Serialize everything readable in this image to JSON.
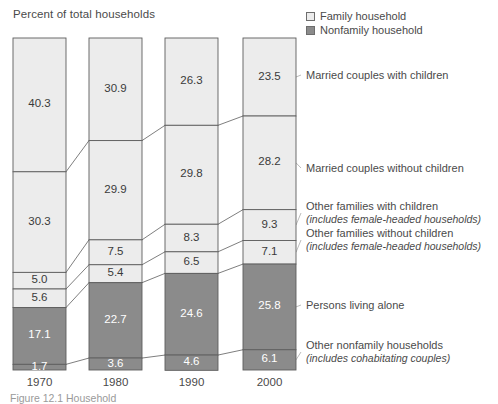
{
  "axis_title": "Percent of total households",
  "legend": {
    "position": "top-right",
    "items": [
      {
        "label": "Family household",
        "swatch": "family",
        "color": "#ececec"
      },
      {
        "label": "Nonfamily household",
        "swatch": "nonfamily",
        "color": "#8b8b8b"
      }
    ]
  },
  "caption": "Figure 12.1  Household",
  "category_labels": [
    {
      "title": "Married couples with children",
      "sub": ""
    },
    {
      "title": "Married couples without children",
      "sub": ""
    },
    {
      "title": "Other families with children",
      "sub": "(includes female-headed households)"
    },
    {
      "title": "Other families without children",
      "sub": "(includes female-headed households)"
    },
    {
      "title": "Persons living alone",
      "sub": ""
    },
    {
      "title": "Other nonfamily households",
      "sub": "(includes cohabitating couples)"
    }
  ],
  "chart_data": {
    "type": "bar",
    "subtype": "100%-stacked-column",
    "title": "Percent of total households",
    "xlabel": "",
    "ylabel": "Percent of total households",
    "ylim": [
      0,
      100
    ],
    "grid": false,
    "legend_position": "top-right",
    "categories": [
      "1970",
      "1980",
      "1990",
      "2000"
    ],
    "series": [
      {
        "name": "Married couples with children",
        "group": "Family household",
        "color": "#ececec",
        "values": [
          40.3,
          30.9,
          26.3,
          23.5
        ]
      },
      {
        "name": "Married couples without children",
        "group": "Family household",
        "color": "#ececec",
        "values": [
          30.3,
          29.9,
          29.8,
          28.2
        ]
      },
      {
        "name": "Other families with children",
        "group": "Family household",
        "color": "#ececec",
        "values": [
          5.0,
          7.5,
          8.3,
          9.3
        ]
      },
      {
        "name": "Other families without children",
        "group": "Family household",
        "color": "#ececec",
        "values": [
          5.6,
          5.4,
          6.5,
          7.1
        ]
      },
      {
        "name": "Persons living alone",
        "group": "Nonfamily household",
        "color": "#8b8b8b",
        "values": [
          17.1,
          22.7,
          24.6,
          25.8
        ]
      },
      {
        "name": "Other nonfamily households",
        "group": "Nonfamily household",
        "color": "#8b8b8b",
        "values": [
          1.7,
          3.6,
          4.6,
          6.1
        ]
      }
    ],
    "value_labels": {
      "1970": [
        "40.3",
        "30.3",
        "5.0",
        "5.6",
        "17.1",
        "1.7"
      ],
      "1980": [
        "30.9",
        "29.9",
        "7.5",
        "5.4",
        "22.7",
        "3.6"
      ],
      "1990": [
        "26.3",
        "29.8",
        "8.3",
        "6.5",
        "24.6",
        "4.6"
      ],
      "2000": [
        "23.5",
        "28.2",
        "9.3",
        "7.1",
        "25.8",
        "6.1"
      ]
    }
  }
}
